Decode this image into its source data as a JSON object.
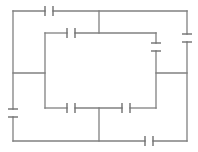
{
  "diagram": {
    "type": "circuit",
    "colors": {
      "wire": "#808080",
      "background": "#ffffff"
    },
    "wires": [
      {
        "id": "top",
        "x1": 13,
        "y1": 11,
        "x2": 45,
        "y2": 11
      },
      {
        "id": "top-b",
        "x1": 53,
        "y1": 11,
        "x2": 187,
        "y2": 11
      },
      {
        "id": "mid-vert-top",
        "x1": 99,
        "y1": 11,
        "x2": 99,
        "y2": 33
      },
      {
        "id": "upper-a",
        "x1": 45,
        "y1": 33,
        "x2": 67,
        "y2": 33
      },
      {
        "id": "upper-b",
        "x1": 75,
        "y1": 33,
        "x2": 156,
        "y2": 33
      },
      {
        "id": "left-outer-a",
        "x1": 13,
        "y1": 11,
        "x2": 13,
        "y2": 109
      },
      {
        "id": "left-outer-b",
        "x1": 13,
        "y1": 117,
        "x2": 13,
        "y2": 141
      },
      {
        "id": "left-inner",
        "x1": 45,
        "y1": 33,
        "x2": 45,
        "y2": 108
      },
      {
        "id": "left-link",
        "x1": 13,
        "y1": 73,
        "x2": 45,
        "y2": 73
      },
      {
        "id": "right-inner-a",
        "x1": 156,
        "y1": 33,
        "x2": 156,
        "y2": 43
      },
      {
        "id": "right-inner-b",
        "x1": 156,
        "y1": 51,
        "x2": 156,
        "y2": 108
      },
      {
        "id": "right-outer-a",
        "x1": 187,
        "y1": 11,
        "x2": 187,
        "y2": 34
      },
      {
        "id": "right-outer-b",
        "x1": 187,
        "y1": 42,
        "x2": 187,
        "y2": 141
      },
      {
        "id": "right-link",
        "x1": 156,
        "y1": 73,
        "x2": 187,
        "y2": 73
      },
      {
        "id": "lower-a",
        "x1": 45,
        "y1": 108,
        "x2": 67,
        "y2": 108
      },
      {
        "id": "lower-b",
        "x1": 75,
        "y1": 108,
        "x2": 122,
        "y2": 108
      },
      {
        "id": "lower-c",
        "x1": 130,
        "y1": 108,
        "x2": 156,
        "y2": 108
      },
      {
        "id": "mid-vert-bottom",
        "x1": 99,
        "y1": 108,
        "x2": 99,
        "y2": 141
      },
      {
        "id": "bottom-a",
        "x1": 13,
        "y1": 141,
        "x2": 145,
        "y2": 141
      },
      {
        "id": "bottom-b",
        "x1": 153,
        "y1": 141,
        "x2": 187,
        "y2": 141
      }
    ],
    "capacitors": [
      {
        "id": "C-top",
        "orientation": "horizontal",
        "x": 49,
        "y": 11,
        "label": ""
      },
      {
        "id": "C-upper",
        "orientation": "horizontal",
        "x": 71,
        "y": 33,
        "label": ""
      },
      {
        "id": "C-right-inner",
        "orientation": "vertical",
        "x": 156,
        "y": 47,
        "label": ""
      },
      {
        "id": "C-right-outer",
        "orientation": "vertical",
        "x": 187,
        "y": 38,
        "label": ""
      },
      {
        "id": "C-left",
        "orientation": "vertical",
        "x": 13,
        "y": 113,
        "label": ""
      },
      {
        "id": "C-lower-left",
        "orientation": "horizontal",
        "x": 71,
        "y": 108,
        "label": ""
      },
      {
        "id": "C-lower-right",
        "orientation": "horizontal",
        "x": 126,
        "y": 108,
        "label": ""
      },
      {
        "id": "C-bottom",
        "orientation": "horizontal",
        "x": 149,
        "y": 141,
        "label": ""
      }
    ]
  }
}
